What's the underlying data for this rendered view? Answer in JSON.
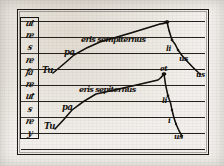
{
  "document": {
    "kind": "manuscript-diagram",
    "title": "Melodic contour diagram",
    "ink_color": "#15120f",
    "parchment_color": "#f2f0ec"
  },
  "frame": {
    "outer_border": true,
    "staff": {
      "line_count": 9,
      "line_y": [
        8,
        24,
        40,
        56,
        72,
        88,
        104,
        120,
        136
      ]
    }
  },
  "letter_column": {
    "label": "pitch-letter-column",
    "glyphs": [
      "ut",
      "re",
      "s",
      "re",
      "fa",
      "re",
      "ut",
      "s",
      "re",
      "y"
    ]
  },
  "melodies": [
    {
      "name": "upper-melody",
      "start_syllable": "Tu",
      "rise_syllable": "pa",
      "phrase": "eris sempiternus",
      "descent_syllables": [
        "li",
        "us",
        "us"
      ],
      "points": [
        {
          "x": 53,
          "y": 73
        },
        {
          "x": 74,
          "y": 55
        },
        {
          "x": 100,
          "y": 42
        },
        {
          "x": 160,
          "y": 24
        },
        {
          "x": 167,
          "y": 22
        },
        {
          "x": 172,
          "y": 40
        },
        {
          "x": 178,
          "y": 50
        },
        {
          "x": 186,
          "y": 60
        },
        {
          "x": 200,
          "y": 74
        }
      ]
    },
    {
      "name": "lower-melody",
      "start_syllable": "Tu",
      "rise_syllable": "pa",
      "phrase": "eris sepiternus",
      "descent_syllables": [
        "li",
        "i",
        "us"
      ],
      "points": [
        {
          "x": 55,
          "y": 129
        },
        {
          "x": 72,
          "y": 110
        },
        {
          "x": 96,
          "y": 94
        },
        {
          "x": 158,
          "y": 80
        },
        {
          "x": 164,
          "y": 74
        },
        {
          "x": 168,
          "y": 96
        },
        {
          "x": 172,
          "y": 110
        },
        {
          "x": 176,
          "y": 124
        },
        {
          "x": 182,
          "y": 136
        }
      ]
    }
  ],
  "annotations": {
    "upper_tu": "Tu",
    "upper_pa": "pa",
    "upper_phrase": "eris sempiternus",
    "upper_peak_mark": "et",
    "upper_d1": "li",
    "upper_d2": "us",
    "upper_d3": "us",
    "lower_tu": "Tu",
    "lower_pa": "pa",
    "lower_phrase": "eris sepiternus",
    "lower_peak_mark": "et",
    "lower_d1": "li",
    "lower_d2": "i",
    "lower_d3": "us"
  }
}
